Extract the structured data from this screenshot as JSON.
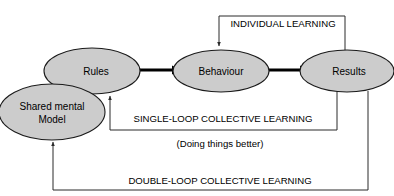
{
  "diagram": {
    "colors": {
      "node_fill": "#cccccc",
      "node_stroke": "#1a1a1a",
      "line": "#2b2b2b",
      "arrow": "#000000",
      "text": "#000000",
      "background": "#ffffff"
    },
    "nodes": [
      {
        "id": "shared-mental-model",
        "label_line1": "Shared mental",
        "label_line2": "Model",
        "cx": 52,
        "cy": 112,
        "rx": 53,
        "ry": 28
      },
      {
        "id": "rules",
        "label": "Rules",
        "cx": 92,
        "cy": 71,
        "rx": 48,
        "ry": 23
      },
      {
        "id": "behaviour",
        "label": "Behaviour",
        "cx": 221,
        "cy": 71,
        "rx": 48,
        "ry": 21
      },
      {
        "id": "results",
        "label": "Results",
        "cx": 347,
        "cy": 71,
        "rx": 47,
        "ry": 21
      }
    ],
    "flows": [
      {
        "id": "rules-to-behaviour",
        "from": "rules",
        "to": "behaviour"
      },
      {
        "id": "behaviour-to-results",
        "from": "behaviour",
        "to": "results"
      }
    ],
    "loops": [
      {
        "id": "individual-learning",
        "label": "INDIVIDUAL LEARNING",
        "label_x": 283,
        "label_y": 27,
        "from": "results",
        "to": "behaviour"
      },
      {
        "id": "single-loop-collective-learning",
        "label": "SINGLE-LOOP COLLECTIVE LEARNING",
        "label_x": 223,
        "label_y": 122,
        "from": "results",
        "to": "rules"
      },
      {
        "id": "double-loop-collective-learning",
        "label": "DOUBLE-LOOP COLLECTIVE LEARNING",
        "label_x": 220,
        "label_y": 184,
        "from": "results",
        "to": "shared-mental-model"
      }
    ],
    "annotations": [
      {
        "id": "doing-things-better",
        "text": "(Doing things better)",
        "x": 220,
        "y": 147
      }
    ]
  }
}
